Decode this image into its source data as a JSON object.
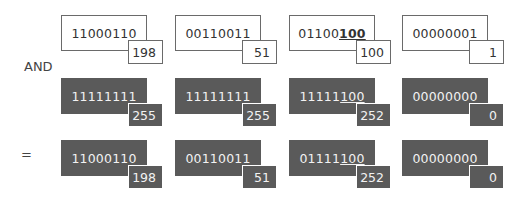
{
  "operators": {
    "and": "AND",
    "equals": "="
  },
  "rows": [
    {
      "name": "operand",
      "style": "light",
      "cells": [
        {
          "prefix": "11000110",
          "suffix": "",
          "decimal": "198"
        },
        {
          "prefix": "00110011",
          "suffix": "",
          "decimal": "51"
        },
        {
          "prefix": "01100",
          "suffix": "100",
          "decimal": "100"
        },
        {
          "prefix": "00000001",
          "suffix": "",
          "decimal": "1"
        }
      ]
    },
    {
      "name": "mask",
      "style": "dark",
      "cells": [
        {
          "prefix": "11111111",
          "suffix": "",
          "decimal": "255"
        },
        {
          "prefix": "11111111",
          "suffix": "",
          "decimal": "255"
        },
        {
          "prefix": "11111",
          "suffix": "100",
          "decimal": "252"
        },
        {
          "prefix": "00000000",
          "suffix": "",
          "decimal": "0"
        }
      ]
    },
    {
      "name": "result",
      "style": "dark",
      "cells": [
        {
          "prefix": "11000110",
          "suffix": "",
          "decimal": "198"
        },
        {
          "prefix": "00110011",
          "suffix": "",
          "decimal": "51"
        },
        {
          "prefix": "01111",
          "suffix": "100",
          "decimal": "252"
        },
        {
          "prefix": "00000000",
          "suffix": "",
          "decimal": "0"
        }
      ]
    }
  ],
  "colors": {
    "dark_fill": "#5a5a5a",
    "border": "#6a6a6a",
    "light_text": "#f2f2f2"
  }
}
